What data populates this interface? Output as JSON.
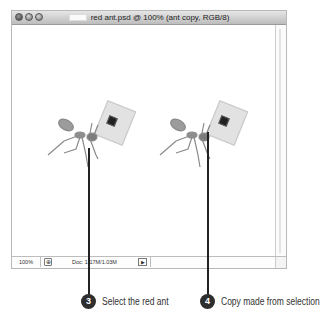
{
  "window": {
    "title": "red ant.psd @ 100% (ant copy, RGB/8)",
    "buttons": [
      "close",
      "minimize",
      "zoom"
    ]
  },
  "canvas": {
    "layers": [
      {
        "name": "red ant",
        "icon": "ant-carrying-chip-image"
      },
      {
        "name": "ant copy",
        "icon": "ant-carrying-chip-image"
      }
    ]
  },
  "statusbar": {
    "zoom": "100%",
    "preview_icon": "⊕",
    "doc_info": "Doc: 1.17M/1.03M",
    "arrow": "▶"
  },
  "callouts": [
    {
      "number": "3",
      "text": "Select the red ant"
    },
    {
      "number": "4",
      "text": "Copy made from selection"
    }
  ],
  "colors": {
    "badge": "#2e2e2e",
    "line": "#222222"
  }
}
